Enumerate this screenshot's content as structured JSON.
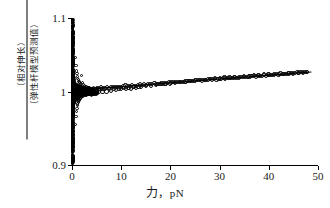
{
  "chart_data": {
    "type": "scatter",
    "title": "",
    "xlabel": "力，pN",
    "xlabel_cjk": "力",
    "xlabel_unit": "，pN",
    "ylabel_numerator": "（相对伸长）",
    "ylabel_denominator": "（弹性杆模型预测值）",
    "ylabel": "（相对伸长）/（弹性杆模型预测值）",
    "xlim": [
      0,
      50
    ],
    "ylim": [
      0.9,
      1.1
    ],
    "xticks": [
      0,
      10,
      20,
      30,
      40,
      50
    ],
    "xtick_labels": [
      "0",
      "10",
      "20",
      "30",
      "40",
      "50"
    ],
    "yticks": [
      0.9,
      1.0,
      1.1
    ],
    "ytick_labels": [
      "0.9",
      "1",
      "1.1"
    ],
    "grid": false,
    "legend": "none",
    "marker": "open-circle",
    "marker_color": "#111111",
    "series": [
      {
        "name": "ratio",
        "points": [
          [
            0.05,
            1.098
          ],
          [
            0.06,
            1.075
          ],
          [
            0.07,
            1.062
          ],
          [
            0.08,
            1.052
          ],
          [
            0.09,
            1.044
          ],
          [
            0.1,
            1.038
          ],
          [
            0.12,
            1.031
          ],
          [
            0.14,
            1.026
          ],
          [
            0.16,
            1.022
          ],
          [
            0.18,
            1.019
          ],
          [
            0.2,
            1.016
          ],
          [
            0.24,
            1.013
          ],
          [
            0.28,
            1.011
          ],
          [
            0.32,
            1.009
          ],
          [
            0.36,
            1.008
          ],
          [
            0.4,
            1.007
          ],
          [
            0.05,
            0.902
          ],
          [
            0.06,
            0.925
          ],
          [
            0.07,
            0.938
          ],
          [
            0.08,
            0.948
          ],
          [
            0.09,
            0.956
          ],
          [
            0.1,
            0.962
          ],
          [
            0.12,
            0.969
          ],
          [
            0.14,
            0.974
          ],
          [
            0.16,
            0.978
          ],
          [
            0.18,
            0.981
          ],
          [
            0.2,
            0.984
          ],
          [
            0.24,
            0.987
          ],
          [
            0.28,
            0.989
          ],
          [
            0.32,
            0.991
          ],
          [
            0.36,
            0.992
          ],
          [
            0.4,
            0.993
          ],
          [
            0.5,
            1.006
          ],
          [
            0.5,
            0.994
          ],
          [
            0.6,
            1.005
          ],
          [
            0.6,
            0.995
          ],
          [
            0.7,
            1.046
          ],
          [
            0.7,
            0.955
          ],
          [
            0.8,
            1.035
          ],
          [
            0.8,
            0.966
          ],
          [
            0.9,
            1.028
          ],
          [
            0.9,
            0.973
          ],
          [
            1.0,
            1.024
          ],
          [
            1.0,
            0.977
          ],
          [
            1.1,
            1.02
          ],
          [
            1.1,
            0.981
          ],
          [
            1.2,
            1.018
          ],
          [
            1.2,
            0.983
          ],
          [
            1.3,
            1.016
          ],
          [
            1.3,
            0.985
          ],
          [
            1.4,
            1.014
          ],
          [
            1.4,
            0.987
          ],
          [
            1.5,
            1.013
          ],
          [
            1.5,
            0.988
          ],
          [
            1.6,
            1.012
          ],
          [
            1.6,
            0.989
          ],
          [
            1.7,
            1.011
          ],
          [
            1.7,
            0.99
          ],
          [
            1.8,
            1.01
          ],
          [
            1.8,
            0.991
          ],
          [
            2.0,
            1.022
          ],
          [
            2.0,
            0.992
          ],
          [
            2.2,
            1.012
          ],
          [
            2.2,
            0.993
          ],
          [
            2.4,
            1.009
          ],
          [
            2.4,
            0.994
          ],
          [
            2.6,
            1.008
          ],
          [
            2.6,
            0.995
          ],
          [
            2.8,
            1.007
          ],
          [
            2.8,
            0.996
          ],
          [
            3.0,
            1.006
          ],
          [
            3.0,
            0.996
          ],
          [
            3.4,
            1.005
          ],
          [
            3.4,
            0.997
          ],
          [
            3.8,
            1.004
          ],
          [
            3.8,
            0.997
          ],
          [
            4.2,
            1.004
          ],
          [
            4.2,
            0.998
          ],
          [
            4.6,
            1.003
          ],
          [
            4.6,
            0.998
          ],
          [
            5.0,
            1.003
          ],
          [
            5.4,
            0.999
          ],
          [
            5.8,
            1.003
          ],
          [
            6.2,
            0.999
          ],
          [
            6.6,
            1.003
          ],
          [
            7.0,
            1.0
          ],
          [
            7.5,
            1.003
          ],
          [
            8.0,
            1.001
          ],
          [
            8.5,
            1.004
          ],
          [
            9.0,
            1.002
          ],
          [
            9.5,
            1.004
          ],
          [
            10.0,
            1.003
          ],
          [
            10.5,
            1.005
          ],
          [
            11.0,
            1.004
          ],
          [
            11.5,
            1.005
          ],
          [
            12.0,
            1.004
          ],
          [
            12.5,
            1.006
          ],
          [
            13.0,
            1.005
          ],
          [
            13.5,
            1.006
          ],
          [
            14.0,
            1.006
          ],
          [
            15.0,
            1.007
          ],
          [
            16.0,
            1.008
          ],
          [
            17.0,
            1.009
          ],
          [
            18.0,
            1.01
          ],
          [
            19.0,
            1.01
          ],
          [
            20.0,
            1.011
          ],
          [
            21.0,
            1.012
          ],
          [
            22.0,
            1.013
          ],
          [
            23.0,
            1.013
          ],
          [
            24.0,
            1.014
          ],
          [
            25.0,
            1.015
          ],
          [
            26.0,
            1.016
          ],
          [
            27.0,
            1.016
          ],
          [
            28.0,
            1.017
          ],
          [
            29.0,
            1.018
          ],
          [
            30.0,
            1.018
          ],
          [
            31.0,
            1.019
          ],
          [
            32.0,
            1.019
          ],
          [
            33.0,
            1.02
          ],
          [
            34.0,
            1.02
          ],
          [
            35.0,
            1.021
          ],
          [
            36.0,
            1.021
          ],
          [
            37.0,
            1.022
          ],
          [
            38.0,
            1.022
          ],
          [
            39.0,
            1.023
          ],
          [
            40.0,
            1.023
          ],
          [
            41.0,
            1.024
          ],
          [
            42.0,
            1.024
          ],
          [
            43.0,
            1.024
          ],
          [
            44.0,
            1.025
          ],
          [
            45.0,
            1.025
          ],
          [
            46.0,
            1.025
          ],
          [
            47.0,
            1.026
          ],
          [
            47.8,
            1.026
          ]
        ]
      }
    ]
  }
}
